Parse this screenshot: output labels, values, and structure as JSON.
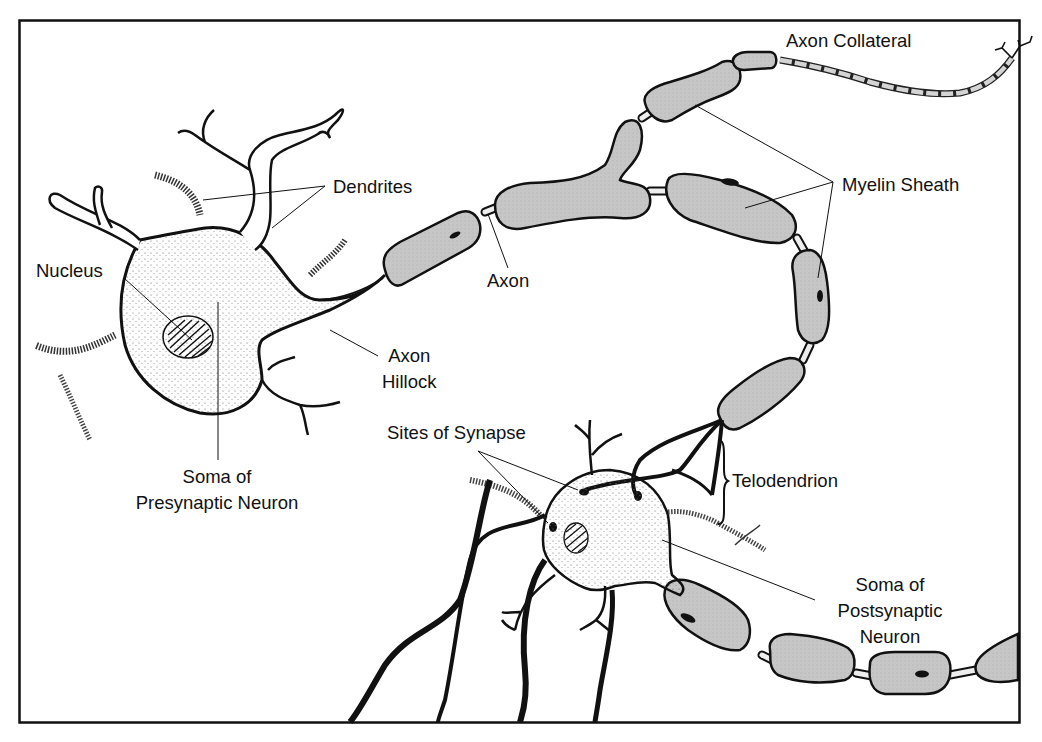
{
  "diagram": {
    "colors": {
      "frame": "#111111",
      "myelin_fill": "#c4c4c4",
      "outline": "#111111",
      "axon_node": "#e8e8e8",
      "background": "#ffffff"
    },
    "labels": {
      "axon_collateral": "Axon Collateral",
      "dendrites": "Dendrites",
      "myelin_sheath": "Myelin Sheath",
      "nucleus": "Nucleus",
      "axon": "Axon",
      "axon_hillock_line1": "Axon",
      "axon_hillock_line2": "Hillock",
      "sites_of_synapse": "Sites of Synapse",
      "telodendrion": "Telodendrion",
      "soma_pre_line1": "Soma of",
      "soma_pre_line2": "Presynaptic Neuron",
      "soma_post_line1": "Soma of",
      "soma_post_line2": "Postsynaptic",
      "soma_post_line3": "Neuron"
    }
  }
}
